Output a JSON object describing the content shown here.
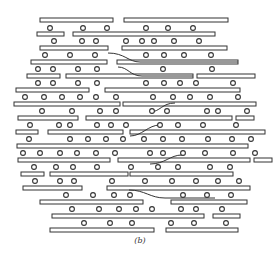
{
  "caption": "(b)",
  "colors": {
    "stroke": "#333333",
    "background": "#ffffff"
  },
  "bar_height": 4,
  "node_radius": 2.4,
  "rows": [
    {
      "y": 20,
      "bars": [
        [
          40,
          113
        ],
        [
          124,
          228
        ]
      ],
      "nodes": []
    },
    {
      "y": 34,
      "bars": [
        [
          37,
          64
        ],
        [
          73,
          215
        ]
      ],
      "nodes": [
        [
          50,
          28
        ],
        [
          83,
          28
        ],
        [
          107,
          28
        ],
        [
          146,
          28
        ],
        [
          168,
          28
        ],
        [
          193,
          28
        ]
      ]
    },
    {
      "y": 48,
      "bars": [
        [
          40,
          108
        ],
        [
          122,
          227
        ]
      ],
      "nodes": [
        [
          54,
          41
        ],
        [
          82,
          41
        ],
        [
          96,
          41
        ],
        [
          126,
          41
        ],
        [
          142,
          41
        ],
        [
          154,
          41
        ],
        [
          174,
          41
        ],
        [
          199,
          41
        ]
      ]
    },
    {
      "y": 62,
      "bars": [
        [
          31,
          107
        ],
        [
          117,
          238
        ]
      ],
      "nodes": [
        [
          45,
          55
        ],
        [
          70,
          55
        ],
        [
          95,
          55
        ],
        [
          146,
          55
        ],
        [
          164,
          55
        ],
        [
          184,
          55
        ],
        [
          211,
          55
        ]
      ]
    },
    {
      "y": 76,
      "bars": [
        [
          27,
          60
        ],
        [
          66,
          193
        ],
        [
          197,
          255
        ]
      ],
      "nodes": [
        [
          38,
          69
        ],
        [
          53,
          69
        ],
        [
          78,
          69
        ],
        [
          97,
          69
        ],
        [
          163,
          69
        ],
        [
          212,
          69
        ]
      ]
    },
    {
      "y": 90,
      "bars": [
        [
          16,
          89
        ],
        [
          105,
          240
        ]
      ],
      "nodes": [
        [
          38,
          83
        ],
        [
          53,
          83
        ],
        [
          78,
          83
        ],
        [
          97,
          83
        ],
        [
          146,
          83
        ],
        [
          164,
          83
        ],
        [
          180,
          83
        ],
        [
          196,
          83
        ],
        [
          233,
          83
        ]
      ]
    },
    {
      "y": 104,
      "bars": [
        [
          14,
          120
        ],
        [
          123,
          256
        ]
      ],
      "nodes": [
        [
          25,
          97
        ],
        [
          44,
          97
        ],
        [
          62,
          97
        ],
        [
          80,
          97
        ],
        [
          96,
          97
        ],
        [
          116,
          97
        ],
        [
          153,
          97
        ],
        [
          173,
          97
        ],
        [
          190,
          97
        ],
        [
          210,
          97
        ],
        [
          238,
          97
        ]
      ]
    },
    {
      "y": 118,
      "bars": [
        [
          18,
          78
        ],
        [
          86,
          232
        ],
        [
          236,
          254
        ]
      ],
      "nodes": [
        [
          42,
          111
        ],
        [
          72,
          111
        ],
        [
          100,
          111
        ],
        [
          116,
          111
        ],
        [
          152,
          111
        ],
        [
          167,
          111
        ],
        [
          207,
          111
        ],
        [
          218,
          111
        ],
        [
          247,
          111
        ]
      ]
    },
    {
      "y": 132,
      "bars": [
        [
          16,
          38
        ],
        [
          48,
          123
        ],
        [
          130,
          265
        ]
      ],
      "nodes": [
        [
          30,
          125
        ],
        [
          59,
          125
        ],
        [
          70,
          125
        ],
        [
          97,
          125
        ],
        [
          111,
          125
        ],
        [
          126,
          125
        ],
        [
          160,
          125
        ],
        [
          178,
          125
        ],
        [
          203,
          125
        ],
        [
          236,
          125
        ]
      ]
    },
    {
      "y": 146,
      "bars": [
        [
          17,
          248
        ]
      ],
      "nodes": [
        [
          29,
          139
        ],
        [
          70,
          139
        ],
        [
          88,
          139
        ],
        [
          106,
          139
        ],
        [
          123,
          139
        ],
        [
          144,
          139
        ],
        [
          163,
          139
        ],
        [
          182,
          139
        ],
        [
          208,
          139
        ],
        [
          232,
          139
        ],
        [
          251,
          139
        ]
      ]
    },
    {
      "y": 160,
      "bars": [
        [
          18,
          110
        ],
        [
          118,
          250
        ],
        [
          254,
          272
        ]
      ],
      "nodes": [
        [
          23,
          153
        ],
        [
          40,
          153
        ],
        [
          60,
          153
        ],
        [
          77,
          153
        ],
        [
          96,
          153
        ],
        [
          115,
          153
        ],
        [
          150,
          153
        ],
        [
          163,
          153
        ],
        [
          183,
          153
        ],
        [
          205,
          153
        ],
        [
          233,
          153
        ],
        [
          255,
          153
        ]
      ]
    },
    {
      "y": 174,
      "bars": [
        [
          21,
          44
        ],
        [
          50,
          128
        ],
        [
          130,
          233
        ]
      ],
      "nodes": [
        [
          34,
          167
        ],
        [
          56,
          167
        ],
        [
          73,
          167
        ],
        [
          97,
          167
        ],
        [
          131,
          167
        ],
        [
          158,
          167
        ],
        [
          178,
          167
        ],
        [
          210,
          167
        ],
        [
          230,
          167
        ]
      ]
    },
    {
      "y": 188,
      "bars": [
        [
          23,
          82
        ],
        [
          107,
          250
        ]
      ],
      "nodes": [
        [
          35,
          181
        ],
        [
          60,
          181
        ],
        [
          74,
          181
        ],
        [
          112,
          181
        ],
        [
          145,
          181
        ],
        [
          172,
          181
        ],
        [
          196,
          181
        ],
        [
          218,
          181
        ],
        [
          239,
          181
        ]
      ]
    },
    {
      "y": 202,
      "bars": [
        [
          40,
          143
        ],
        [
          171,
          247
        ]
      ],
      "nodes": [
        [
          66,
          195
        ],
        [
          93,
          195
        ],
        [
          114,
          195
        ],
        [
          130,
          195
        ],
        [
          183,
          195
        ],
        [
          207,
          195
        ],
        [
          231,
          195
        ]
      ]
    },
    {
      "y": 216,
      "bars": [
        [
          52,
          204
        ],
        [
          213,
          240
        ]
      ],
      "nodes": [
        [
          72,
          209
        ],
        [
          99,
          209
        ],
        [
          119,
          209
        ],
        [
          136,
          209
        ],
        [
          152,
          209
        ],
        [
          181,
          209
        ],
        [
          196,
          209
        ],
        [
          222,
          209
        ]
      ]
    },
    {
      "y": 230,
      "bars": [
        [
          50,
          154
        ],
        [
          166,
          238
        ]
      ],
      "nodes": [
        [
          84,
          223
        ],
        [
          110,
          223
        ],
        [
          132,
          223
        ],
        [
          171,
          223
        ],
        [
          194,
          223
        ],
        [
          226,
          223
        ]
      ]
    }
  ],
  "curves": [
    {
      "d": "M108 53 C 125 53, 128 62, 140 62 L 238 62"
    },
    {
      "d": "M118 67 C 128 67, 130 76, 142 76 L 193 76"
    },
    {
      "d": "M150 112 C 160 112, 162 103, 175 103"
    },
    {
      "d": "M130 136 C 142 136, 148 125, 160 125"
    },
    {
      "d": "M150 164 C 165 164, 170 155, 182 155"
    },
    {
      "d": "M129 190 C 145 190, 150 198, 165 198 L 215 198"
    }
  ]
}
